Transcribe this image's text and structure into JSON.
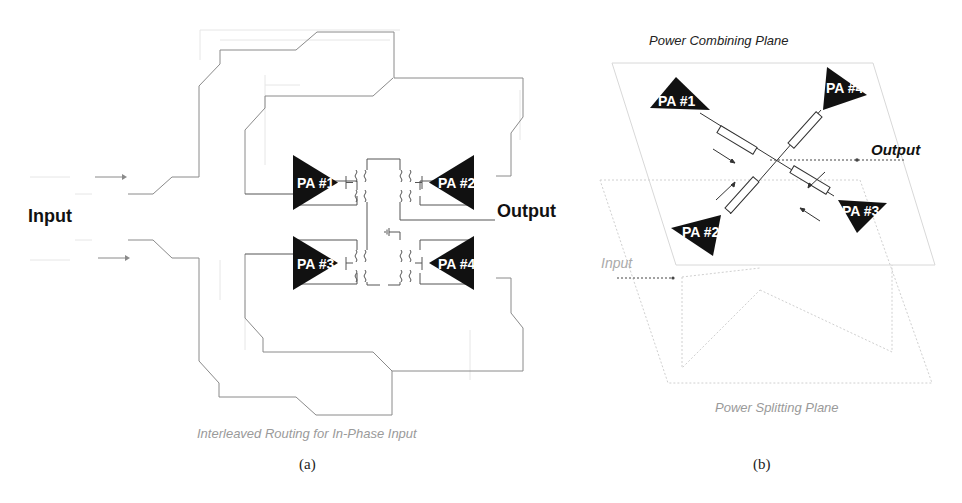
{
  "panel_a": {
    "input_label": "Input",
    "output_label": "Output",
    "caption": "Interleaved Routing for In-Phase Input",
    "sublabel": "(a)",
    "amplifiers": [
      {
        "id": "pa1",
        "label": "PA #1"
      },
      {
        "id": "pa2",
        "label": "PA #2"
      },
      {
        "id": "pa3",
        "label": "PA #3"
      },
      {
        "id": "pa4",
        "label": "PA #4"
      }
    ]
  },
  "panel_b": {
    "top_plane_title": "Power Combining Plane",
    "bottom_plane_title": "Power Splitting Plane",
    "output_label": "Output",
    "input_label": "Input",
    "sublabel": "(b)",
    "amplifiers": [
      {
        "id": "pa1",
        "label": "PA #1"
      },
      {
        "id": "pa2",
        "label": "PA #2"
      },
      {
        "id": "pa3",
        "label": "PA #3"
      },
      {
        "id": "pa4",
        "label": "PA #4"
      }
    ]
  },
  "colors": {
    "amplifier_fill": "#111111",
    "wire": "#8a8a8a",
    "caption_gray": "#9a9a9a"
  }
}
